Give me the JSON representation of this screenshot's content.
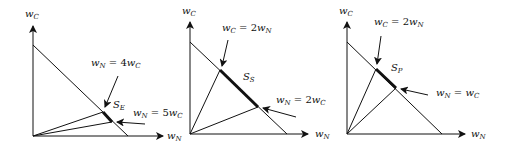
{
  "panels": [
    {
      "id": "E",
      "y_axis": {
        "main": "w",
        "sub": "C"
      },
      "x_axis": {
        "main": "w",
        "sub": "N"
      },
      "segment": {
        "main": "S",
        "sub": "E"
      },
      "upper_label": {
        "a": "w",
        "asub": "N",
        "eq": " = 4",
        "b": "w",
        "bsub": "C"
      },
      "lower_label": {
        "a": "w",
        "asub": "N",
        "eq": " = 5",
        "b": "w",
        "bsub": "C"
      }
    },
    {
      "id": "S",
      "y_axis": {
        "main": "w",
        "sub": "C"
      },
      "x_axis": {
        "main": "w",
        "sub": "N"
      },
      "segment": {
        "main": "S",
        "sub": "S"
      },
      "upper_label": {
        "a": "w",
        "asub": "C",
        "eq": " = 2",
        "b": "w",
        "bsub": "N"
      },
      "lower_label": {
        "a": "w",
        "asub": "N",
        "eq": " = 2",
        "b": "w",
        "bsub": "C"
      }
    },
    {
      "id": "P",
      "y_axis": {
        "main": "w",
        "sub": "C"
      },
      "x_axis": {
        "main": "w",
        "sub": "N"
      },
      "segment": {
        "main": "S",
        "sub": "P"
      },
      "upper_label": {
        "a": "w",
        "asub": "C",
        "eq": " = 2",
        "b": "w",
        "bsub": "N"
      },
      "lower_label": {
        "a": "w",
        "asub": "N",
        "eq": " = ",
        "b": "w",
        "bsub": "C"
      }
    }
  ]
}
